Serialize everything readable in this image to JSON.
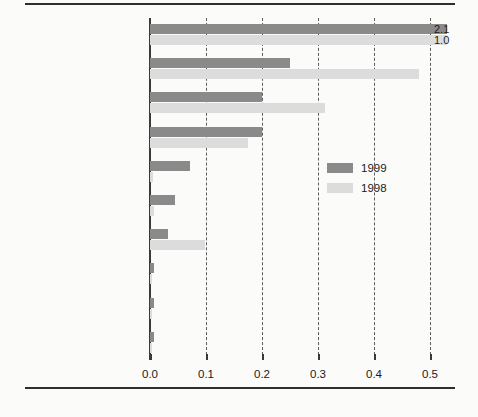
{
  "chart_data": {
    "type": "bar",
    "orientation": "horizontal",
    "title": "",
    "xlabel": "",
    "ylabel": "",
    "xlim": [
      0.0,
      0.5
    ],
    "grid": true,
    "grid_style": "dashed vertical gridlines",
    "legend_position": "middle-right inside plot",
    "xticks": [
      "0.0",
      "0.1",
      "0.2",
      "0.3",
      "0.4",
      "0.5"
    ],
    "xtick_values": [
      0.0,
      0.1,
      0.2,
      0.3,
      0.4,
      0.5
    ],
    "categories": [
      "Russian Federation",
      "Hungary",
      "Poland",
      "Czech Republic",
      "Estonia",
      "Slovenia",
      "Croatia",
      "Romania",
      "Lithuania",
      "Ukraine"
    ],
    "series": [
      {
        "name": "1999",
        "color": "#8a8a8a",
        "values": [
          2.1,
          0.25,
          0.2,
          0.2,
          0.072,
          0.045,
          0.033,
          0.008,
          0.008,
          0.007
        ]
      },
      {
        "name": "1998",
        "color": "#dcdcdc",
        "values": [
          1.0,
          0.48,
          0.313,
          0.175,
          0.005,
          0.007,
          0.098,
          0.004,
          0.004,
          0.003
        ]
      }
    ],
    "annotations": [
      {
        "category": "Russian Federation",
        "series": "1999",
        "label": "2.1"
      },
      {
        "category": "Russian Federation",
        "series": "1998",
        "label": "1.0"
      }
    ]
  },
  "legend": {
    "items": [
      {
        "label": "1999",
        "color": "#8a8a8a"
      },
      {
        "label": "1998",
        "color": "#dcdcdc"
      }
    ]
  }
}
